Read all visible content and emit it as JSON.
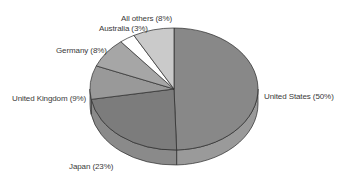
{
  "chart_data": {
    "type": "pie",
    "style": "3d",
    "title": "",
    "categories": [
      "United States",
      "Japan",
      "United Kingdom",
      "Germany",
      "Australia",
      "All others"
    ],
    "values": [
      50,
      23,
      9,
      8,
      3,
      8
    ],
    "unit": "%",
    "labels": [
      "United States (50%)",
      "Japan (23%)",
      "United Kingdom (9%)",
      "Germany (8%)",
      "Australia (3%)",
      "All others (8%)"
    ],
    "colors": [
      "#888888",
      "#7c7c7c",
      "#999999",
      "#a6a6a6",
      "#ffffff",
      "#cacaca"
    ],
    "side_colors": [
      "#9a9a9a",
      "#8a8a8a",
      "#a8a8a8",
      "#b2b2b2",
      "#eeeeee",
      "#d4d4d4"
    ],
    "start_angle_deg": 0,
    "direction": "clockwise-from-top",
    "legend": "none (direct labels)",
    "grid": false
  }
}
